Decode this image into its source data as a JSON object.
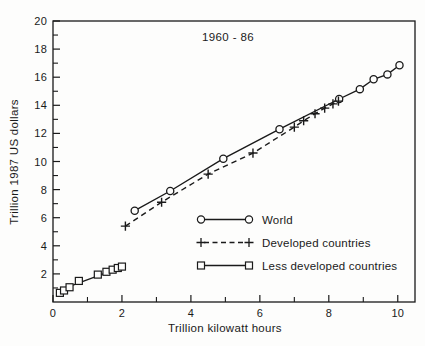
{
  "chart_data": {
    "type": "line",
    "title": "1960 - 86",
    "xlabel": "Trillion kilowatt hours",
    "ylabel": "Trillion 1987 US dollars",
    "xlim": [
      0,
      10.5
    ],
    "ylim": [
      0,
      20
    ],
    "x_major_ticks": [
      0,
      2,
      4,
      6,
      8,
      10
    ],
    "x_minor_ticks": [
      1,
      3,
      5,
      7,
      9
    ],
    "y_major_ticks": [
      2,
      4,
      6,
      8,
      10,
      12,
      14,
      16,
      18,
      20
    ],
    "y_minor_ticks": [
      1,
      3,
      5,
      7,
      9,
      11,
      13,
      15,
      17,
      19
    ],
    "grid": false,
    "legend_position": "inside-lower-right",
    "colors": {
      "ink": "#1a1a1a",
      "background": "#fdfdfc"
    },
    "series": [
      {
        "name": "World",
        "marker": "circle",
        "line_style": "solid",
        "points": [
          [
            2.37,
            6.5
          ],
          [
            3.4,
            7.9
          ],
          [
            4.94,
            10.2
          ],
          [
            6.57,
            12.3
          ],
          [
            8.3,
            14.45
          ],
          [
            8.9,
            15.15
          ],
          [
            9.3,
            15.85
          ],
          [
            9.7,
            16.2
          ],
          [
            10.05,
            16.85
          ]
        ]
      },
      {
        "name": "Developed countries",
        "marker": "plus",
        "line_style": "dashed",
        "points": [
          [
            2.1,
            5.4
          ],
          [
            3.15,
            7.1
          ],
          [
            4.5,
            9.1
          ],
          [
            5.8,
            10.6
          ],
          [
            7.0,
            12.45
          ],
          [
            7.27,
            12.9
          ],
          [
            7.6,
            13.4
          ],
          [
            7.88,
            13.8
          ],
          [
            8.12,
            14.1
          ],
          [
            8.28,
            14.3
          ]
        ]
      },
      {
        "name": "Less developed countries",
        "marker": "square",
        "line_style": "solid",
        "points": [
          [
            0.2,
            0.65
          ],
          [
            0.32,
            0.82
          ],
          [
            0.48,
            1.05
          ],
          [
            0.75,
            1.5
          ],
          [
            1.3,
            1.95
          ],
          [
            1.55,
            2.15
          ],
          [
            1.73,
            2.3
          ],
          [
            1.88,
            2.42
          ],
          [
            2.0,
            2.52
          ]
        ],
        "line_points": [
          [
            0.13,
            0.8
          ],
          [
            2.0,
            2.5
          ]
        ]
      }
    ]
  }
}
